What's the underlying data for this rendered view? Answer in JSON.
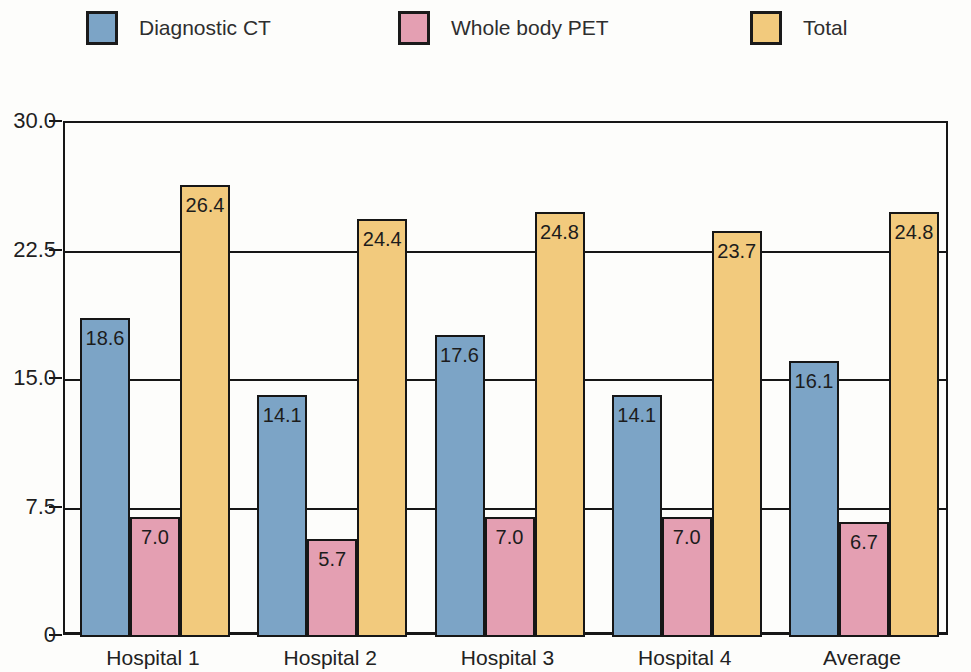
{
  "chart_data": {
    "type": "bar",
    "title": "",
    "xlabel": "",
    "ylabel": "",
    "categories": [
      "Hospital 1",
      "Hospital 2",
      "Hospital 3",
      "Hospital 4",
      "Average"
    ],
    "series": [
      {
        "name": "Diagnostic CT",
        "color": "#7CA4C6",
        "values": [
          18.6,
          14.1,
          17.6,
          14.1,
          16.1
        ]
      },
      {
        "name": "Whole body PET",
        "color": "#E49FB2",
        "values": [
          7.0,
          5.7,
          7.0,
          7.0,
          6.7
        ]
      },
      {
        "name": "Total",
        "color": "#F2CA7D",
        "values": [
          26.4,
          24.4,
          24.8,
          23.7,
          24.8
        ]
      }
    ],
    "ylim": [
      0,
      30
    ],
    "yticks": [
      0,
      7.5,
      15.0,
      22.5,
      30.0
    ],
    "ytick_labels": [
      "0",
      "7.5",
      "15.0",
      "22.5",
      "30.0"
    ],
    "grid": true,
    "legend_position": "top",
    "bar_value_labels_shown": true,
    "colors": {
      "axis_line": "#161616",
      "text": "#222222",
      "background": "#fdfdfb"
    }
  }
}
